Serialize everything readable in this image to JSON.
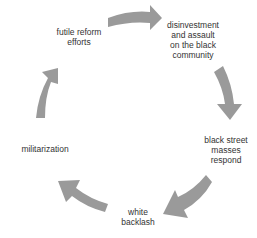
{
  "diagram": {
    "type": "cycle",
    "arrow_color": "#9a9a9a",
    "text_color": "#333333",
    "nodes": [
      {
        "id": "disinvestment",
        "lines": [
          "disinvestment",
          "and assault",
          "on the black",
          "community"
        ]
      },
      {
        "id": "black-street-masses",
        "lines": [
          "black street",
          "masses",
          "respond"
        ]
      },
      {
        "id": "white-backlash",
        "lines": [
          "white",
          "backlash"
        ]
      },
      {
        "id": "militarization",
        "lines": [
          "militarization"
        ]
      },
      {
        "id": "futile-reform",
        "lines": [
          "futile reform",
          "efforts"
        ]
      }
    ],
    "edges": [
      {
        "from": "futile-reform",
        "to": "disinvestment"
      },
      {
        "from": "disinvestment",
        "to": "black-street-masses"
      },
      {
        "from": "black-street-masses",
        "to": "white-backlash"
      },
      {
        "from": "white-backlash",
        "to": "militarization"
      },
      {
        "from": "militarization",
        "to": "futile-reform"
      }
    ]
  }
}
